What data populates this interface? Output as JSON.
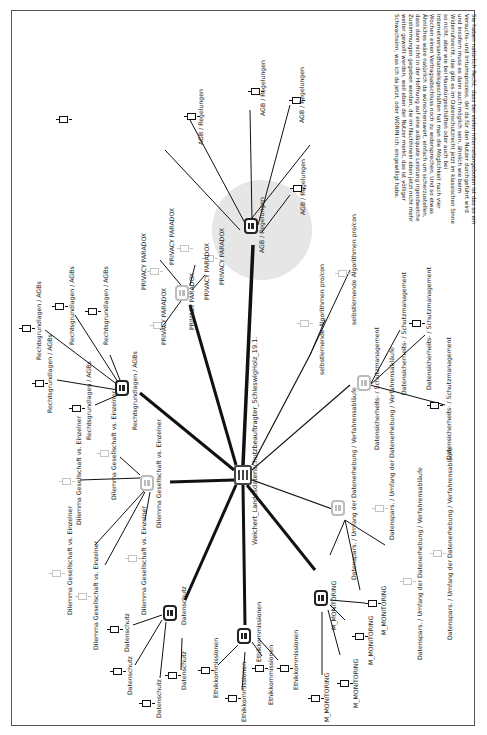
{
  "diagram": {
    "central_topic": "Weichert_Landesdatenschutzbeauftragter_SchleswigHolz_19.1.",
    "paragraph": "Sie haben natürlich Recht, dass bei vielen Internetangeboten ist das so ein Versuchs- und Irrtumsprozess, der da für den Nutzer durchgeführt wird und insofern muss es dann auch möglich sein, ähnlich wie beim Widerrufsrecht, das gibt es im Datenschutzrecht jetzt im klassischen Sinne so nicht, aber wie bei Haustürgeschäften oder auch bei Internetversandhandelsgeschäften hat man die Möglichkeit nach vier Wochen einen Vertragsabschluss noch zu widersprechen. Und so etwas Ähnliches wäre natürlich da wünschenswert, einfach um sicherzustellen, dass dann nicht in der Hoffnung auf eine adäquate Leistung irgendwelche Zustimmungen gegeben werden, die im Nachhinein eben jetzt nicht mehr weiter gewollt werden, weil eben der Nutzer merkt, das ist völliger Schwachsinn, was ich da jetzt, oder WORIN ich, eingewilligt habe.",
    "branches": [
      {
        "name": "AGB / Regelungen",
        "hub_label": "AGB / Regelungen",
        "leaves": [
          "AGB / Regelungen",
          "AGB / Regelungen",
          "AGB / Regelungen",
          "AGB / Regelungen"
        ],
        "faded": false
      },
      {
        "name": "PRIVACY PARADOX",
        "hub_label": "PRIVACY PARADOX",
        "leaves": [
          "PRIVACY PARADOX",
          "PRIVACY PARADOX",
          "PRIVACY PARADOX",
          "PRIVACY PARADOX",
          "PRIVACY PARADOX"
        ],
        "faded": true
      },
      {
        "name": "Rechtsgrundlagen / AGBs",
        "hub_label": "Rechtsgrundlagen / AGBs",
        "leaves": [
          "Rechtsgrundlagen / AGBs",
          "Rechtsgrundlagen / AGBs",
          "Rechtsgrundlagen / AGBs",
          "Rechtsgrundlagen / AGBs",
          "Rechtsgrundlagen / AGBs"
        ],
        "faded": false
      },
      {
        "name": "Dilemma Gesellschaft vs. Einzelner",
        "hub_label": "Dilemma Gesellschaft vs. Einzelner",
        "leaves": [
          "Dilemma Gesellschaft vs. Einzelner",
          "Dilemma Gesellschaft vs. Einzelner",
          "Dilemma Gesellschaft vs. Einzelner",
          "Dilemma Gesellschaft vs. Einzelner",
          "Dilemma Gesellschaft vs. Einzelner"
        ],
        "faded": true
      },
      {
        "name": "Datenschutz",
        "hub_label": "Datenschutz",
        "leaves": [
          "Datenschutz",
          "Datenschutz",
          "Datenschutz",
          "Datenschutz"
        ],
        "faded": false
      },
      {
        "name": "Ethikkommissionen",
        "hub_label": "Ethikkommissionen",
        "leaves": [
          "Ethikkommissionen",
          "Ethikkommissionen",
          "Ethikkommissionen",
          "Ethikkommissionen"
        ],
        "faded": false
      },
      {
        "name": "M_MONITORING",
        "hub_label": "M_MONITORING",
        "leaves": [
          "M_MONITORING",
          "M_MONITORING",
          "M_MONITORING",
          "M_MONITORING"
        ],
        "faded": false
      },
      {
        "name": "Datensparsamkeit",
        "hub_label": "Datenspars. / Umfang der Datenerhebung / Verfahrensabläufe",
        "leaves": [
          "Datenspars. / Umfang der Datenerhebung / Verfahrensabläufe",
          "Datenspars. / Umfang der Datenerhebung / Verfahrensabläufe",
          "Datenspars. / Umfang der Datenerhebung / Verfahrensabläufe"
        ],
        "faded": true
      },
      {
        "name": "Datensicherheit",
        "hub_label": "Datensicherheits- / Schutzmanagement",
        "leaves": [
          "Datensicherheits- / Schutzmanagement",
          "Datensicherheits- / Schutzmanagement",
          "Datensicherheits- / Schutzmanagement"
        ],
        "faded": true
      },
      {
        "name": "selbstlernende Algorithmen",
        "hub_label": "selbstlernende Algorithmen pro/con",
        "leaves": [
          "selbstlernende Algorithmen pro/con",
          "selbstlernende Algorithmen pro/con"
        ],
        "faded": true
      }
    ]
  }
}
